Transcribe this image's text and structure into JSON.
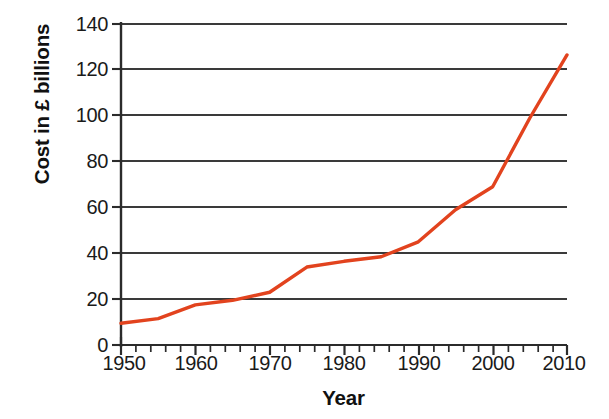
{
  "chart_data": {
    "type": "line",
    "title": "",
    "xlabel": "Year",
    "ylabel": "Cost in £ billions",
    "xlim": [
      1950,
      2010
    ],
    "ylim": [
      0,
      140
    ],
    "xticks": [
      1950,
      1960,
      1970,
      1980,
      1990,
      2000,
      2010
    ],
    "xtick_labels": [
      "1950",
      "1960",
      "1970",
      "1980",
      "1990",
      "2000",
      "2010"
    ],
    "x_minor_tick_interval": 2,
    "yticks": [
      0,
      20,
      40,
      60,
      80,
      100,
      120,
      140
    ],
    "ytick_labels": [
      "0",
      "20",
      "40",
      "60",
      "80",
      "100",
      "120",
      "140"
    ],
    "grid": "horizontal",
    "grid_color": "#3a3a3a",
    "legend": "none",
    "line_color": "#e2431e",
    "line_width": 3.4,
    "x": [
      1950,
      1955,
      1960,
      1965,
      1970,
      1975,
      1980,
      1985,
      1990,
      1995,
      2000,
      2005,
      2010
    ],
    "values": [
      9.5,
      11.5,
      17.5,
      19.5,
      23,
      34,
      36.5,
      38.5,
      45,
      59,
      69,
      99,
      126.5
    ],
    "series": [
      {
        "name": "Cost in £ billions",
        "values": [
          9.5,
          11.5,
          17.5,
          19.5,
          23,
          34,
          36.5,
          38.5,
          45,
          59,
          69,
          99,
          126.5
        ]
      }
    ]
  },
  "colors": {
    "line": "#e2431e",
    "grid": "#3a3a3a",
    "axis": "#2b2b2b",
    "text": "#1a1a1a",
    "background": "#ffffff"
  }
}
